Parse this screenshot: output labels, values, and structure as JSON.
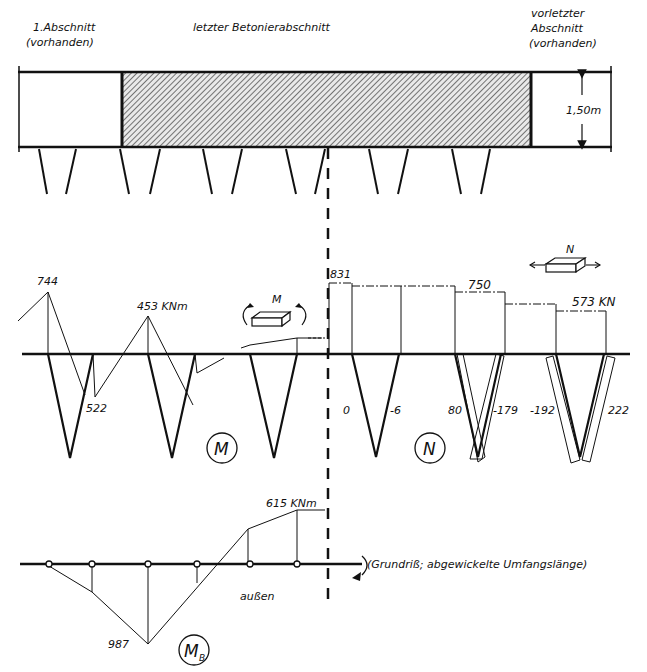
{
  "colors": {
    "ink": "#111111",
    "paper": "#ffffff",
    "hatch": "#555555"
  },
  "header": {
    "left_section": {
      "line1": "1.Abschnitt",
      "line2": "(vorhanden)"
    },
    "middle_section": {
      "label": "letzter Betonierabschnitt"
    },
    "right_section": {
      "line1": "vorletzter",
      "line2": "Abschnitt",
      "line3": "(vorhanden)"
    }
  },
  "plan": {
    "dimension_label": "1,50m",
    "wall": {
      "x0": 18,
      "x1": 612,
      "top": 72,
      "bottom": 147
    },
    "left_block_x1": 122,
    "right_block_x0": 531,
    "piles": [
      {
        "top": 39,
        "bot": 47
      },
      {
        "top": 76,
        "bot": 66
      },
      {
        "top": 120,
        "bot": 129
      },
      {
        "top": 160,
        "bot": 150
      },
      {
        "top": 203,
        "bot": 212
      },
      {
        "top": 242,
        "bot": 232
      },
      {
        "top": 286,
        "bot": 296
      },
      {
        "top": 325,
        "bot": 315
      },
      {
        "top": 369,
        "bot": 378
      },
      {
        "top": 408,
        "bot": 398
      },
      {
        "top": 452,
        "bot": 461
      },
      {
        "top": 490,
        "bot": 481
      }
    ],
    "centerline_x": 328
  },
  "moment_diagram": {
    "symbol": "M",
    "unit_label": "453 KNm",
    "values": {
      "peak_left": "744",
      "dip": "522"
    },
    "baseline_y": 354,
    "icon_label": "M"
  },
  "normal_force_diagram": {
    "symbol": "N",
    "icon_label": "N",
    "top_values": [
      "831",
      "750",
      "573 KN"
    ],
    "pile_values": [
      "0",
      "-6",
      "80",
      "-179",
      "-192",
      "222"
    ],
    "steps": [
      {
        "x0": 329,
        "x1": 352,
        "y": 283
      },
      {
        "x0": 352,
        "x1": 455,
        "y": 286
      },
      {
        "x0": 455,
        "x1": 505,
        "y": 292
      },
      {
        "x0": 505,
        "x1": 556,
        "y": 304
      },
      {
        "x0": 556,
        "x1": 606,
        "y": 311
      }
    ]
  },
  "bending_diagram": {
    "symbol": "M",
    "subscript": "B",
    "top_value": "615 KNm",
    "bottom_value": "987",
    "inner_label": "außen",
    "note": "(Grundriß; abgewickelte Umfangslänge)",
    "baseline_y": 564
  },
  "chart_data": {
    "type": "diagram",
    "panels": [
      {
        "name": "M",
        "unit": "KNm",
        "labels": [
          "744",
          "453 KNm",
          "522"
        ]
      },
      {
        "name": "N",
        "unit": "KN",
        "top_values": [
          831,
          750,
          573
        ],
        "pile_values": [
          0,
          -6,
          80,
          -179,
          -192,
          222
        ]
      },
      {
        "name": "M_B",
        "unit": "KNm",
        "values": [
          615,
          -987
        ]
      }
    ],
    "dimension": "1,50m"
  }
}
